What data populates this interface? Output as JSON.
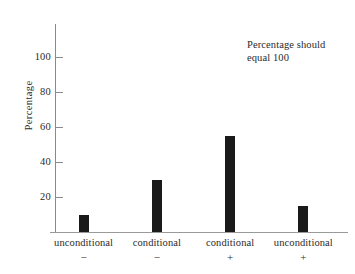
{
  "chart_data": {
    "type": "bar",
    "title": "",
    "xlabel": "",
    "ylabel": "Percentage",
    "ylim": [
      0,
      100
    ],
    "yticks": [
      20,
      40,
      60,
      80,
      100
    ],
    "grid": false,
    "legend": "none",
    "categories": [
      "unconditional",
      "conditional",
      "conditional",
      "unconditional"
    ],
    "category_signs": [
      "−",
      "−",
      "+",
      "+"
    ],
    "category_labels": [
      "unconditional −",
      "conditional −",
      "conditional +",
      "unconditional +"
    ],
    "values": [
      10,
      30,
      55,
      15
    ],
    "bar_color": "#1a1a1a",
    "axis_color": "#8a8a8a",
    "annotations": [
      {
        "line1": "Percentage should",
        "line2": "equal 100"
      }
    ]
  },
  "axis": {
    "y_title": "Percentage",
    "y_tick_labels": [
      "100",
      "80",
      "60",
      "40",
      "20"
    ]
  },
  "annotation": {
    "line1": "Percentage should",
    "line2": "equal 100"
  }
}
